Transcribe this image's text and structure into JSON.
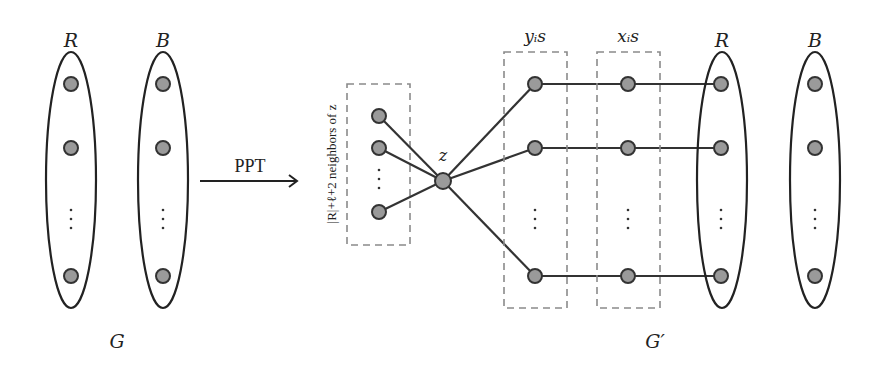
{
  "left_graph": {
    "label": "G",
    "sets": [
      {
        "label": "R",
        "nodes": 3,
        "ellipsis": "⋮"
      },
      {
        "label": "B",
        "nodes": 3,
        "ellipsis": "⋮"
      }
    ]
  },
  "transform": {
    "label": "PPT"
  },
  "right_graph": {
    "label": "G′",
    "center_node_label": "z",
    "neighbors_label": "|R|+ℓ+2 neighbors of z",
    "groups": [
      {
        "label": "yᵢs"
      },
      {
        "label": "xᵢs"
      }
    ],
    "sets": [
      {
        "label": "R",
        "nodes": 3
      },
      {
        "label": "B",
        "nodes": 3
      }
    ]
  },
  "colors": {
    "node_fill": "#9a9a9a",
    "stroke": "#333333",
    "dashed_box": "#8a8a8a"
  }
}
